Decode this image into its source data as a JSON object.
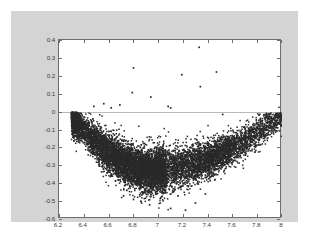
{
  "figure": {
    "background_color": "#d4d4d4",
    "page_background_color": "#ffffff",
    "axes_background_color": "#ffffff",
    "axes_border_color": "#6e6e6e",
    "marker_color": "#2a2a2a",
    "zero_line_color": "#b9b9b9"
  },
  "chart_data": {
    "type": "scatter",
    "title": "",
    "xlabel": "",
    "ylabel": "",
    "xlim": [
      6.2,
      8.0
    ],
    "ylim": [
      -0.6,
      0.4
    ],
    "xticks": [
      6.2,
      6.4,
      6.6,
      6.8,
      7.0,
      7.2,
      7.4,
      7.6,
      7.8,
      8.0
    ],
    "yticks": [
      0.4,
      0.3,
      0.2,
      0.1,
      0.0,
      -0.1,
      -0.2,
      -0.3,
      -0.4,
      -0.5,
      -0.6
    ],
    "xtick_labels": [
      "6.2",
      "6.4",
      "6.6",
      "6.8",
      "7",
      "7.2",
      "7.4",
      "7.6",
      "7.8",
      "8"
    ],
    "ytick_labels": [
      "0.4",
      "0.3",
      "0.2",
      "0.1",
      "0",
      "-0.1",
      "-0.2",
      "-0.3",
      "-0.4",
      "-0.5",
      "-0.6"
    ],
    "grid": false,
    "legend": null,
    "marker": "point",
    "marker_size": 1.5,
    "n_points": 9000,
    "reference_lines": [
      {
        "axis": "horizontal",
        "value": 0.0
      }
    ],
    "shape_profile": {
      "x_start": 6.3,
      "x_end": 8.0,
      "x_min_of_curve": 6.95,
      "y_at_x_start": -0.02,
      "y_at_minimum": -0.33,
      "y_at_x_end": -0.02,
      "spread_at_start": 0.1,
      "spread_at_minimum": 0.12,
      "spread_at_end": 0.09
    },
    "outliers": [
      {
        "x": 6.56,
        "y": 0.045
      },
      {
        "x": 6.62,
        "y": 0.022
      },
      {
        "x": 6.69,
        "y": 0.038
      },
      {
        "x": 6.79,
        "y": 0.107
      },
      {
        "x": 6.8,
        "y": 0.245
      },
      {
        "x": 6.94,
        "y": 0.082
      },
      {
        "x": 7.08,
        "y": 0.03
      },
      {
        "x": 7.1,
        "y": 0.022
      },
      {
        "x": 7.19,
        "y": 0.207
      },
      {
        "x": 7.33,
        "y": 0.36
      },
      {
        "x": 7.34,
        "y": 0.14
      },
      {
        "x": 7.47,
        "y": 0.222
      },
      {
        "x": 6.48,
        "y": 0.03
      },
      {
        "x": 7.52,
        "y": -0.015
      },
      {
        "x": 7.95,
        "y": -0.01
      }
    ],
    "low_outliers": [
      {
        "x": 6.72,
        "y": -0.47
      },
      {
        "x": 6.8,
        "y": -0.49
      },
      {
        "x": 6.86,
        "y": -0.5
      },
      {
        "x": 6.93,
        "y": -0.52
      },
      {
        "x": 7.02,
        "y": -0.48
      },
      {
        "x": 7.1,
        "y": -0.54
      },
      {
        "x": 7.16,
        "y": -0.47
      },
      {
        "x": 7.22,
        "y": -0.55
      },
      {
        "x": 7.3,
        "y": -0.51
      },
      {
        "x": 7.38,
        "y": -0.46
      }
    ]
  }
}
